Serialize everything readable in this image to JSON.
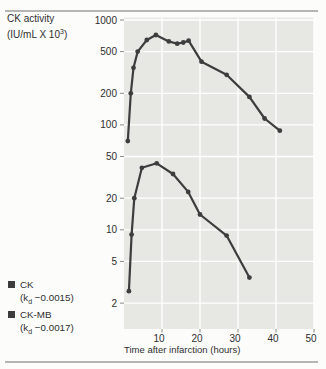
{
  "figure": {
    "y_axis_title": {
      "line1": "CK activity",
      "unit_prefix": "(IU/mL X 10",
      "unit_exponent": "3",
      "unit_suffix": ")"
    },
    "legend": [
      {
        "name": "CK",
        "k_prefix": "(k",
        "k_sub": "d",
        "k_value": " −0.0015)"
      },
      {
        "name": "CK-MB",
        "k_prefix": "(k",
        "k_sub": "d",
        "k_value": " −0.0017)"
      }
    ]
  },
  "chart_data": {
    "type": "line",
    "title": "",
    "ylabel": "CK activity (IU/mL X 10^3)",
    "xlabel": "Time after infarction (hours)",
    "y_scale": "log",
    "x_range": [
      0,
      50
    ],
    "x_ticks": [
      10,
      20,
      30,
      40,
      50
    ],
    "y_ticks": [
      1000,
      500,
      200,
      100,
      50,
      20,
      10,
      5,
      2
    ],
    "y_range": [
      1.1,
      1050
    ],
    "grid": true,
    "legend_position": "bottom-left",
    "colors": {
      "plot_bg": "#e7e7e4",
      "grid": "#ffffff",
      "line": "#3d3d3d",
      "tick": "#8a8a8a",
      "rule": "#b5b5b5"
    },
    "series": [
      {
        "name": "CK",
        "kd": -0.0015,
        "points": [
          [
            1,
            70
          ],
          [
            1.8,
            200
          ],
          [
            2.5,
            350
          ],
          [
            3.6,
            500
          ],
          [
            6,
            645
          ],
          [
            8.4,
            720
          ],
          [
            11.8,
            625
          ],
          [
            14,
            595
          ],
          [
            15.6,
            610
          ],
          [
            17,
            635
          ],
          [
            20.4,
            400
          ],
          [
            27,
            300
          ],
          [
            33,
            185
          ],
          [
            37,
            115
          ],
          [
            41,
            88
          ]
        ]
      },
      {
        "name": "CK-MB",
        "kd": -0.0017,
        "points": [
          [
            1.3,
            2.6
          ],
          [
            2,
            9
          ],
          [
            2.7,
            20
          ],
          [
            4.7,
            39
          ],
          [
            8.6,
            43
          ],
          [
            12.9,
            34
          ],
          [
            16.9,
            23
          ],
          [
            20,
            14
          ],
          [
            27,
            8.8
          ],
          [
            33,
            3.5
          ]
        ]
      }
    ]
  }
}
